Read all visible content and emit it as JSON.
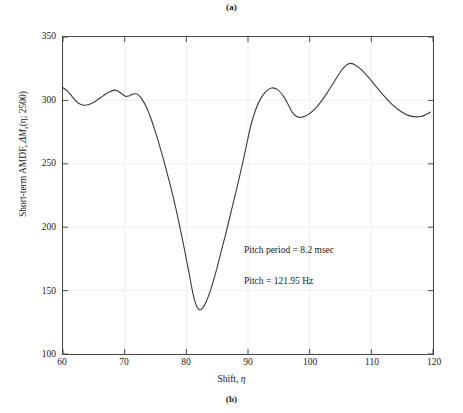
{
  "figure": {
    "caption_top": "(a)",
    "caption_bottom": "(b)"
  },
  "axes": {
    "ylabel_prefix": "Short-term AMDF, ",
    "ylabel_symbol": "ΔM",
    "ylabel_subscript": "s",
    "ylabel_args": "(η; 2500)",
    "xlabel_prefix": "Shift, ",
    "xlabel_symbol": "η",
    "ytick_labels": [
      "350",
      "300",
      "250",
      "200",
      "150",
      "100"
    ],
    "xtick_labels": [
      "60",
      "70",
      "80",
      "90",
      "100",
      "110",
      "120"
    ]
  },
  "annotations": {
    "pitch_period": "Pitch period = 8.2 msec",
    "pitch": "Pitch = 121.95 Hz"
  },
  "colors": {
    "curve": "#3a3a3a",
    "frame": "#4a4a4a",
    "grid": "#efefef",
    "text": "#1a1a1a",
    "background": "#ffffff"
  },
  "chart_data": {
    "type": "line",
    "title": "",
    "xlabel": "Shift, η",
    "ylabel": "Short-term AMDF, ΔM_s(η; 2500)",
    "xlim": [
      60,
      120
    ],
    "ylim": [
      100,
      350
    ],
    "xticks": [
      60,
      70,
      80,
      90,
      100,
      110,
      120
    ],
    "yticks": [
      100,
      150,
      200,
      250,
      300,
      350
    ],
    "grid": true,
    "legend": null,
    "series": [
      {
        "name": "Short-term AMDF",
        "x": [
          60.0,
          60.7,
          61.4,
          62.1,
          62.8,
          63.5,
          64.2,
          65.0,
          65.7,
          66.4,
          67.1,
          67.8,
          68.3,
          68.8,
          69.3,
          69.8,
          70.2,
          70.6,
          71.0,
          71.4,
          71.8,
          72.3,
          72.8,
          73.5,
          74.2,
          75.0,
          75.8,
          76.6,
          77.4,
          78.2,
          79.0,
          79.8,
          80.4,
          80.9,
          81.3,
          81.7,
          82.1,
          82.6,
          83.2,
          83.9,
          84.7,
          85.5,
          86.4,
          87.3,
          88.2,
          89.1,
          89.9,
          90.5,
          91.2,
          92.0,
          92.9,
          93.8,
          94.8,
          95.8,
          96.6,
          97.2,
          97.9,
          98.8,
          99.8,
          100.9,
          102.0,
          103.1,
          104.2,
          105.2,
          106.0,
          106.6,
          107.3,
          108.2,
          109.3,
          110.5,
          111.8,
          113.1,
          114.3,
          115.4,
          116.4,
          117.3,
          118.0,
          118.6,
          119.1,
          119.6
        ],
        "y": [
          310.0,
          307.5,
          303.5,
          299.5,
          297.0,
          296.2,
          296.8,
          298.5,
          300.8,
          303.2,
          305.6,
          307.3,
          308.1,
          307.6,
          306.0,
          304.2,
          303.2,
          303.4,
          304.3,
          305.1,
          305.2,
          304.0,
          301.0,
          295.0,
          286.5,
          275.0,
          262.0,
          248.0,
          233.0,
          217.0,
          199.0,
          180.0,
          165.0,
          152.0,
          143.0,
          137.5,
          135.0,
          136.0,
          141.0,
          150.0,
          163.0,
          178.0,
          195.0,
          213.0,
          231.0,
          250.0,
          268.0,
          281.0,
          292.0,
          301.0,
          307.0,
          309.8,
          308.5,
          303.0,
          296.0,
          290.5,
          287.3,
          286.8,
          289.0,
          293.5,
          300.0,
          308.0,
          316.5,
          324.0,
          328.0,
          329.2,
          328.2,
          325.0,
          319.5,
          312.5,
          305.0,
          298.0,
          293.0,
          289.5,
          287.6,
          287.0,
          287.3,
          288.2,
          289.4,
          290.8
        ]
      }
    ],
    "annotations": [
      {
        "text": "Pitch period = 8.2 msec",
        "x": 89.5,
        "y": 193
      },
      {
        "text": "Pitch = 121.95 Hz",
        "x": 89.5,
        "y": 169
      }
    ]
  }
}
